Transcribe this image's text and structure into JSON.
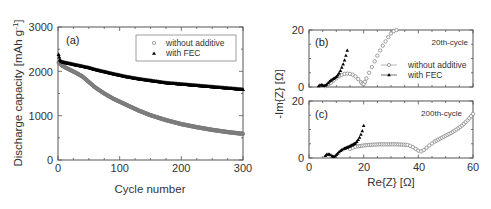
{
  "chart_data": [
    {
      "panel": "(a)",
      "type": "scatter",
      "title": "",
      "xlabel": "Cycle number",
      "ylabel": "Discharge capacity [mAh g⁻¹]",
      "xlim": [
        0,
        300
      ],
      "ylim": [
        0,
        3000
      ],
      "xticks": [
        "0",
        "100",
        "200",
        "300"
      ],
      "yticks": [
        "0",
        "1000",
        "2000",
        "3000"
      ],
      "grid": false,
      "legend_position": "upper right",
      "series": [
        {
          "name": "without additive",
          "marker": "open-circle",
          "color": "#888888",
          "x": [
            1,
            5,
            10,
            20,
            30,
            40,
            50,
            60,
            75,
            90,
            110,
            130,
            150,
            175,
            200,
            225,
            250,
            275,
            300
          ],
          "y": [
            2200,
            2150,
            2100,
            2030,
            1960,
            1880,
            1760,
            1640,
            1500,
            1380,
            1250,
            1120,
            1010,
            900,
            810,
            740,
            680,
            630,
            590
          ]
        },
        {
          "name": "with FEC",
          "marker": "filled-triangle",
          "color": "#000000",
          "x": [
            1,
            3,
            5,
            10,
            20,
            30,
            40,
            50,
            60,
            75,
            90,
            110,
            130,
            150,
            175,
            200,
            225,
            250,
            275,
            300
          ],
          "y": [
            2380,
            2260,
            2220,
            2200,
            2170,
            2140,
            2110,
            2080,
            2040,
            1990,
            1940,
            1880,
            1830,
            1790,
            1740,
            1710,
            1680,
            1650,
            1620,
            1590
          ]
        }
      ]
    },
    {
      "panel": "(b)",
      "type": "scatter",
      "annotation": "20th-cycle",
      "xlabel": "Re{Z} [Ω]",
      "ylabel": "-Im{Z} [Ω]",
      "xlim": [
        0,
        60
      ],
      "ylim": [
        0,
        20
      ],
      "xticks": [
        "0",
        "20",
        "40",
        "60"
      ],
      "yticks": [
        "0",
        "20"
      ],
      "legend_position": "center right",
      "series": [
        {
          "name": "without additive",
          "marker": "open-circle-line",
          "color": "#888888",
          "x": [
            6,
            7,
            8,
            9,
            10,
            11,
            12,
            13,
            14,
            15,
            16,
            17,
            18,
            19,
            19.5,
            20,
            20.5,
            21,
            22,
            23,
            24,
            25,
            26,
            27,
            28,
            29,
            30,
            31,
            32
          ],
          "y": [
            0.3,
            0.8,
            1.5,
            2.3,
            3.1,
            3.8,
            4.3,
            4.6,
            4.7,
            4.6,
            4.3,
            3.7,
            2.8,
            1.7,
            1.2,
            1.0,
            1.8,
            3.0,
            5.0,
            7.0,
            9.0,
            11.0,
            12.8,
            14.5,
            16.0,
            17.5,
            18.8,
            19.6,
            20.0
          ]
        },
        {
          "name": "with FEC",
          "marker": "filled-triangle-line",
          "color": "#000000",
          "x": [
            3.5,
            4,
            4.5,
            5,
            5.5,
            6,
            6.5,
            7,
            7.5,
            8,
            8.5,
            9,
            9.5,
            10,
            10.5,
            11,
            11.5,
            12,
            12.5,
            13,
            13.5,
            14
          ],
          "y": [
            0.3,
            0.6,
            0.7,
            0.6,
            0.4,
            0.5,
            0.9,
            1.4,
            1.9,
            2.3,
            2.6,
            2.9,
            3.2,
            3.6,
            4.1,
            4.8,
            5.7,
            6.8,
            8.0,
            9.4,
            11.0,
            12.8
          ]
        }
      ]
    },
    {
      "panel": "(c)",
      "type": "scatter",
      "annotation": "200th-cycle",
      "xlabel": "Re{Z} [Ω]",
      "ylabel": "-Im{Z} [Ω]",
      "xlim": [
        0,
        60
      ],
      "ylim": [
        0,
        20
      ],
      "xticks": [
        "0",
        "20",
        "40",
        "60"
      ],
      "yticks": [
        "0",
        "20"
      ],
      "series": [
        {
          "name": "without additive",
          "marker": "open-circle",
          "color": "#888888",
          "x": [
            15,
            16,
            17,
            18,
            20,
            22,
            24,
            26,
            28,
            30,
            32,
            34,
            36,
            37,
            38,
            39,
            40,
            41,
            42,
            43,
            44,
            45,
            46,
            48,
            50,
            52,
            54,
            56,
            58,
            60
          ],
          "y": [
            3.2,
            3.6,
            3.9,
            4.1,
            4.4,
            4.6,
            4.7,
            4.8,
            4.8,
            4.8,
            4.8,
            4.7,
            4.6,
            4.3,
            3.8,
            3.2,
            2.6,
            2.3,
            2.8,
            3.6,
            4.4,
            5.1,
            5.8,
            6.8,
            7.8,
            8.8,
            10.0,
            11.4,
            13.2,
            15.5
          ]
        },
        {
          "name": "with FEC",
          "marker": "filled-triangle",
          "color": "#000000",
          "x": [
            6,
            6.5,
            7,
            7.5,
            8,
            8.5,
            9,
            9.5,
            10,
            10.5,
            11,
            11.5,
            12,
            12.5,
            13,
            14,
            15,
            16,
            17,
            17.5,
            18,
            18.5,
            19,
            19.5,
            20
          ],
          "y": [
            0.8,
            1.2,
            1.3,
            1.2,
            1.0,
            0.6,
            0.4,
            0.6,
            1.1,
            1.6,
            2.1,
            2.5,
            2.8,
            3.1,
            3.3,
            3.7,
            4.1,
            4.6,
            5.2,
            5.7,
            6.4,
            7.2,
            8.2,
            9.5,
            11.3
          ]
        }
      ]
    }
  ],
  "panel_a": {
    "label": "(a)",
    "xlabel": "Cycle number",
    "ylabel": "Discharge capacity [mAh g",
    "ylabel_sup": "-1",
    "ylabel_end": "]",
    "xticks": [
      "0",
      "100",
      "200",
      "300"
    ],
    "yticks": [
      "0",
      "1000",
      "2000",
      "3000"
    ],
    "legend": [
      "without additive",
      "with FEC"
    ]
  },
  "panel_b": {
    "label": "(b)",
    "note": "20th-cycle",
    "yticks": [
      "0",
      "20"
    ],
    "legend": [
      "without additive",
      "with FEC"
    ]
  },
  "panel_c": {
    "label": "(c)",
    "note": "200th-cycle",
    "yticks": [
      "0",
      "20"
    ],
    "xticks": [
      "0",
      "20",
      "40",
      "60"
    ]
  },
  "shared": {
    "ylabel_bc": "-Im{Z} [Ω]",
    "xlabel_bc": "Re{Z} [Ω]"
  }
}
